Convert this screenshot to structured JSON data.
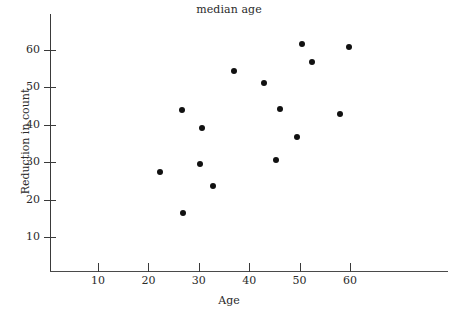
{
  "chart_data": {
    "type": "scatter",
    "title": "median age",
    "xlabel": "Age",
    "ylabel": "Reduction in count",
    "xlim": [
      2,
      81
    ],
    "ylim": [
      0,
      70
    ],
    "xticks": [
      10,
      20,
      30,
      40,
      50,
      60
    ],
    "yticks": [
      10,
      20,
      30,
      40,
      50,
      60
    ],
    "grid": false,
    "legend": null,
    "marker": "filled-circle",
    "marker_color": "#111111",
    "points": [
      {
        "x": 22.3,
        "y": 27.4
      },
      {
        "x": 26.7,
        "y": 43.9
      },
      {
        "x": 26.9,
        "y": 16.4
      },
      {
        "x": 30.2,
        "y": 29.5
      },
      {
        "x": 30.6,
        "y": 39.1
      },
      {
        "x": 32.8,
        "y": 23.6
      },
      {
        "x": 37.0,
        "y": 54.4
      },
      {
        "x": 42.9,
        "y": 51.2
      },
      {
        "x": 45.3,
        "y": 30.6
      },
      {
        "x": 46.1,
        "y": 44.2
      },
      {
        "x": 49.5,
        "y": 36.7
      },
      {
        "x": 50.5,
        "y": 61.6
      },
      {
        "x": 52.5,
        "y": 56.8
      },
      {
        "x": 58.0,
        "y": 42.9
      },
      {
        "x": 59.8,
        "y": 60.8
      }
    ]
  }
}
